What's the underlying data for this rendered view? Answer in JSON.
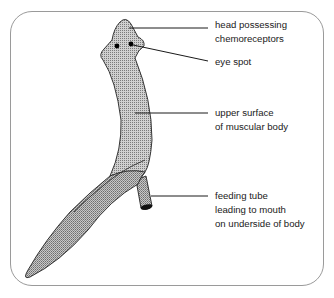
{
  "diagram": {
    "colors": {
      "frame": "#9a9a9a",
      "body_fill": "#b8b8b8",
      "outline": "#222222",
      "leader_line": "#1a1a1a",
      "eye": "#000000"
    },
    "labels": [
      {
        "id": "head",
        "lines": [
          "head possessing",
          "chemoreceptors"
        ]
      },
      {
        "id": "eye",
        "lines": [
          "eye spot"
        ]
      },
      {
        "id": "body",
        "lines": [
          "upper surface",
          "of muscular body"
        ]
      },
      {
        "id": "tube",
        "lines": [
          "feeding tube",
          "leading to mouth",
          "on underside of body"
        ]
      }
    ]
  }
}
